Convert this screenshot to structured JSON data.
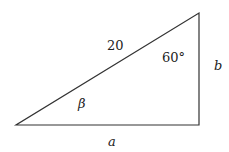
{
  "diagram": {
    "type": "right-triangle",
    "labels": {
      "hypotenuse": "20",
      "angle_top": "60°",
      "angle_left": "β",
      "side_right": "b",
      "side_bottom": "a"
    },
    "colors": {
      "stroke": "#333333",
      "background": "#ffffff"
    }
  }
}
